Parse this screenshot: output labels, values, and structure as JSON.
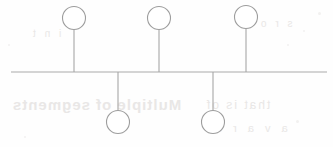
{
  "document": {
    "title": "Stemmed Circle Diagram",
    "medium": "scanned line drawing",
    "background_color": "#fefefe",
    "ink_color": "#a6a6a6"
  },
  "diagram": {
    "type": "node-stem-baseline",
    "baseline": {
      "name": "horizontal-baseline",
      "x_start": 11,
      "x_end": 327,
      "y": 72,
      "stroke": "#a9a9a9",
      "stroke_width": 1.2
    },
    "geometry": {
      "width": 333,
      "height": 147,
      "circle_radius": 11.5,
      "stroke": "#9d9d9d",
      "stroke_width": 1.1,
      "fill": "#ffffff"
    },
    "nodes": [
      {
        "id": "node-up-1",
        "label": "upper-left-circle",
        "side": "above",
        "cx": 74,
        "cy": 18,
        "r": 11.5,
        "stem_x": 74,
        "stem_y_start": 29.5,
        "stem_y_end": 72
      },
      {
        "id": "node-down-1",
        "label": "lower-left-circle",
        "side": "below",
        "cx": 118,
        "cy": 122,
        "r": 11.5,
        "stem_x": 118,
        "stem_y_start": 72,
        "stem_y_end": 110.5
      },
      {
        "id": "node-up-2",
        "label": "upper-middle-circle",
        "side": "above",
        "cx": 159,
        "cy": 18,
        "r": 11.5,
        "stem_x": 159,
        "stem_y_start": 29.5,
        "stem_y_end": 72
      },
      {
        "id": "node-down-2",
        "label": "lower-right-circle",
        "side": "below",
        "cx": 213,
        "cy": 122,
        "r": 11.5,
        "stem_x": 213,
        "stem_y_start": 72,
        "stem_y_end": 110.5
      },
      {
        "id": "node-up-3",
        "label": "upper-right-circle",
        "side": "above",
        "cx": 246,
        "cy": 17,
        "r": 11.5,
        "stem_x": 246,
        "stem_y_start": 28.5,
        "stem_y_end": 72
      }
    ],
    "counts": {
      "total_nodes": 5,
      "nodes_above": 3,
      "nodes_below": 2
    }
  },
  "artifacts": {
    "description": "faint bleed-through of text printed on the reverse of the page; illegible",
    "marks": [
      {
        "id": "bleed-a",
        "text": "Multiple of segments"
      },
      {
        "id": "bleed-b",
        "text": "that is of"
      },
      {
        "id": "bleed-c",
        "text": "a v a r e"
      },
      {
        "id": "bleed-d",
        "text": "s r o"
      },
      {
        "id": "bleed-e",
        "text": "i n t"
      }
    ],
    "specks": [
      {
        "x": 318,
        "y": 12,
        "size": 3
      },
      {
        "x": 303,
        "y": 30,
        "size": 2
      },
      {
        "x": 287,
        "y": 44,
        "size": 2
      },
      {
        "x": 24,
        "y": 136,
        "size": 2
      },
      {
        "x": 296,
        "y": 120,
        "size": 3
      },
      {
        "x": 8,
        "y": 44,
        "size": 2
      }
    ]
  }
}
